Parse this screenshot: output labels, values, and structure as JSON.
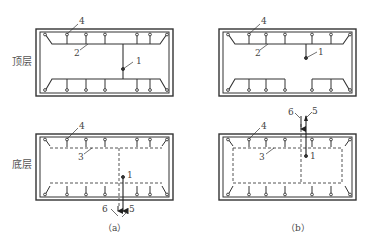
{
  "row_labels": {
    "top": "顶层",
    "bottom": "底层"
  },
  "captions": {
    "a": "（a）",
    "b": "（b）"
  },
  "callouts": {
    "n1": "1",
    "n2": "2",
    "n3": "3",
    "n4": "4",
    "n5": "5",
    "n6": "6"
  },
  "colors": {
    "line": "#333333",
    "dashed": "#555555",
    "text": "#444444"
  }
}
